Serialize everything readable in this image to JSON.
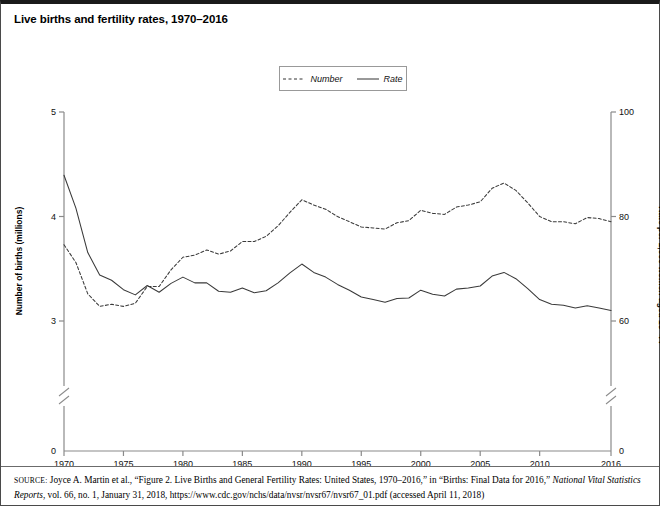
{
  "figure": {
    "title": "Live births and fertility rates, 1970–2016"
  },
  "legend": {
    "items": [
      {
        "label": "Number",
        "style": "dashed",
        "color": "#333333"
      },
      {
        "label": "Rate",
        "style": "solid",
        "color": "#333333"
      }
    ]
  },
  "axes": {
    "y_left_title": "Number of births (millions)",
    "y_right_title": "Rate per 1,000 women aged 15–44",
    "y_left_ticks": [
      "0",
      "3",
      "4",
      "5"
    ],
    "y_right_ticks": [
      "0",
      "60",
      "80",
      "100"
    ],
    "x_ticks": [
      "1970",
      "1975",
      "1980",
      "1985",
      "1990",
      "1995",
      "2000",
      "2005",
      "2010",
      "2016"
    ],
    "axis_break": true
  },
  "source": {
    "label": "SOURCE:",
    "text_1": " Joyce A. Martin et al., “Figure 2. Live Births and General Fertility Rates: United States, 1970–2016,” in “Births: Final Data for 2016,” ",
    "italic_1": "National Vital Statistics Reports",
    "text_2": ", vol. 66, no. 1, January 31, 2018, https://www.cdc.gov/nchs/data/nvsr/nvsr67/nvsr67_01.pdf (accessed April 11, 2018)"
  },
  "chart_data": {
    "type": "line",
    "title": "Live births and fertility rates, 1970–2016",
    "xlabel": "",
    "ylabel": "Number of births (millions)",
    "y2label": "Rate per 1,000 women aged 15–44",
    "xlim": [
      1970,
      2016
    ],
    "ylim": [
      0,
      5
    ],
    "y2lim": [
      0,
      100
    ],
    "y_break_between": [
      0,
      2.6
    ],
    "grid": false,
    "legend_position": "top-center",
    "x": [
      1970,
      1971,
      1972,
      1973,
      1974,
      1975,
      1976,
      1977,
      1978,
      1979,
      1980,
      1981,
      1982,
      1983,
      1984,
      1985,
      1986,
      1987,
      1988,
      1989,
      1990,
      1991,
      1992,
      1993,
      1994,
      1995,
      1996,
      1997,
      1998,
      1999,
      2000,
      2001,
      2002,
      2003,
      2004,
      2005,
      2006,
      2007,
      2008,
      2009,
      2010,
      2011,
      2012,
      2013,
      2014,
      2015,
      2016
    ],
    "series": [
      {
        "name": "Number",
        "unit": "millions of live births",
        "axis": "left",
        "style": "dashed",
        "values": [
          3.73,
          3.56,
          3.26,
          3.14,
          3.16,
          3.14,
          3.17,
          3.33,
          3.33,
          3.49,
          3.61,
          3.63,
          3.68,
          3.64,
          3.67,
          3.76,
          3.76,
          3.81,
          3.91,
          4.04,
          4.16,
          4.11,
          4.07,
          4.0,
          3.95,
          3.9,
          3.89,
          3.88,
          3.94,
          3.96,
          4.06,
          4.03,
          4.02,
          4.09,
          4.11,
          4.14,
          4.27,
          4.32,
          4.25,
          4.13,
          4.0,
          3.95,
          3.95,
          3.93,
          3.99,
          3.98,
          3.95
        ]
      },
      {
        "name": "Rate",
        "unit": "births per 1,000 women aged 15–44",
        "axis": "right",
        "style": "solid",
        "values": [
          87.9,
          81.6,
          73.1,
          68.8,
          67.8,
          66.0,
          65.0,
          66.8,
          65.5,
          67.2,
          68.4,
          67.3,
          67.3,
          65.7,
          65.5,
          66.3,
          65.4,
          65.8,
          67.3,
          69.2,
          70.9,
          69.3,
          68.4,
          67.0,
          65.9,
          64.6,
          64.1,
          63.6,
          64.3,
          64.4,
          65.9,
          65.1,
          64.8,
          66.1,
          66.3,
          66.7,
          68.6,
          69.3,
          68.1,
          66.2,
          64.1,
          63.2,
          63.0,
          62.5,
          62.9,
          62.5,
          62.0
        ]
      }
    ]
  }
}
